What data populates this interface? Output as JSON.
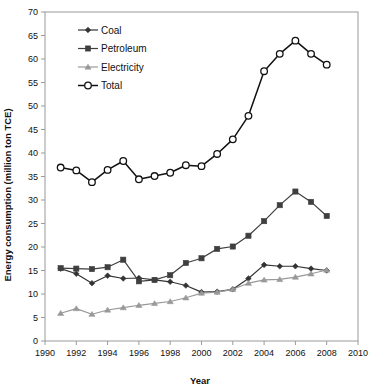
{
  "chart_data": {
    "type": "line",
    "title": "",
    "subtitle": "",
    "xlabel": "Year",
    "ylabel": "Energy consumption (million ton TCE)",
    "xlim": [
      1990,
      2010
    ],
    "ylim": [
      0,
      70
    ],
    "xticks": [
      1990,
      1992,
      1994,
      1996,
      1998,
      2000,
      2002,
      2004,
      2006,
      2008,
      2010
    ],
    "yticks": [
      0,
      5,
      10,
      15,
      20,
      25,
      30,
      35,
      40,
      45,
      50,
      55,
      60,
      65,
      70
    ],
    "xtick_labels": [
      "1990",
      "1992",
      "1994",
      "1996",
      "1998",
      "2000",
      "2002",
      "2004",
      "2006",
      "2008",
      "2010"
    ],
    "ytick_labels": [
      "0",
      "5",
      "10",
      "15",
      "20",
      "25",
      "30",
      "35",
      "40",
      "45",
      "50",
      "55",
      "60",
      "65",
      "70"
    ],
    "grid": false,
    "legend_position": "upper-left",
    "x": [
      1991,
      1992,
      1993,
      1994,
      1995,
      1996,
      1997,
      1998,
      1999,
      2000,
      2001,
      2002,
      2003,
      2004,
      2005,
      2006,
      2007,
      2008
    ],
    "series": [
      {
        "name": "Coal",
        "marker": "diamond",
        "color": "#333333",
        "values": [
          15.4,
          14.3,
          12.3,
          13.9,
          13.3,
          13.4,
          13.0,
          12.6,
          11.8,
          10.4,
          10.5,
          11.0,
          13.3,
          16.2,
          15.9,
          15.9,
          15.4,
          15.0
        ]
      },
      {
        "name": "Petroleum",
        "marker": "square",
        "color": "#3f3f3f",
        "values": [
          15.5,
          15.4,
          15.3,
          15.7,
          17.3,
          12.7,
          13.0,
          14.0,
          16.6,
          17.6,
          19.6,
          20.1,
          22.4,
          25.5,
          28.9,
          31.8,
          29.6,
          26.6
        ]
      },
      {
        "name": "Electricity",
        "marker": "triangle",
        "color": "#999999",
        "values": [
          5.9,
          6.9,
          5.7,
          6.6,
          7.1,
          7.6,
          8.0,
          8.4,
          9.2,
          10.2,
          10.4,
          11.0,
          12.3,
          13.0,
          13.1,
          13.6,
          14.3,
          15.1
        ]
      },
      {
        "name": "Total",
        "marker": "circle-open",
        "color": "#111111",
        "values": [
          36.9,
          36.3,
          33.8,
          36.4,
          38.3,
          34.4,
          35.1,
          35.8,
          37.4,
          37.2,
          39.8,
          42.9,
          47.9,
          57.4,
          61.1,
          63.9,
          61.1,
          58.8
        ]
      }
    ]
  },
  "legend": {
    "items": [
      {
        "label": "Coal"
      },
      {
        "label": "Petroleum"
      },
      {
        "label": "Electricity"
      },
      {
        "label": "Total"
      }
    ]
  },
  "colors": {
    "coal": "#333333",
    "petroleum": "#3f3f3f",
    "electricity": "#999999",
    "total": "#111111",
    "axis": "#9a9a9a",
    "text": "#111111",
    "background": "#ffffff"
  }
}
